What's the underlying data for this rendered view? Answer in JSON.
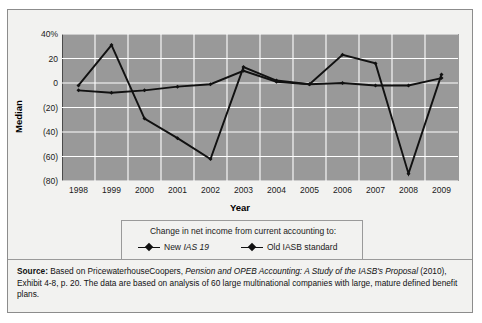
{
  "figure": {
    "y_axis_title": "Median",
    "x_axis_title": "Year"
  },
  "legend": {
    "title": "Change in net income from current accounting to:",
    "entries": [
      {
        "label_pre": "New ",
        "label_em": "IAS 19",
        "label_post": "",
        "name": "new-ias-19"
      },
      {
        "label_pre": "Old IASB standard",
        "label_em": "",
        "label_post": "",
        "name": "old-iasb-standard"
      }
    ]
  },
  "source": {
    "label": "Source:",
    "text_1": " Based on PricewaterhouseCoopers, ",
    "italic_1": "Pension and OPEB Accounting: A Study of the IASB's Proposal",
    "text_2": " (2010), Exhibit 4-8, p. 20. The data are based on analysis of 60 large multinational companies with large, mature defined benefit plans."
  },
  "chart_data": {
    "type": "line",
    "title": "",
    "xlabel": "Year",
    "ylabel": "Median",
    "categories": [
      "1998",
      "1999",
      "2000",
      "2001",
      "2002",
      "2003",
      "2004",
      "2005",
      "2006",
      "2007",
      "2008",
      "2009"
    ],
    "ylim": [
      -80,
      40
    ],
    "yticks": [
      40,
      20,
      0,
      -20,
      -40,
      -60,
      -80
    ],
    "ytick_labels": [
      "40%",
      "20",
      "0",
      "(20)",
      "(40)",
      "(60)",
      "(80)"
    ],
    "grid": true,
    "legend_position": "below",
    "series": [
      {
        "name": "New IAS 19",
        "color": "#111111",
        "values": [
          -2,
          31,
          -29,
          -45,
          -62,
          13,
          2,
          -1,
          23,
          16,
          -74,
          7
        ]
      },
      {
        "name": "Old IASB standard",
        "color": "#111111",
        "values": [
          -6,
          -8,
          -6,
          -3,
          -1,
          10,
          1,
          -1,
          0,
          -2,
          -2,
          4
        ]
      }
    ]
  }
}
